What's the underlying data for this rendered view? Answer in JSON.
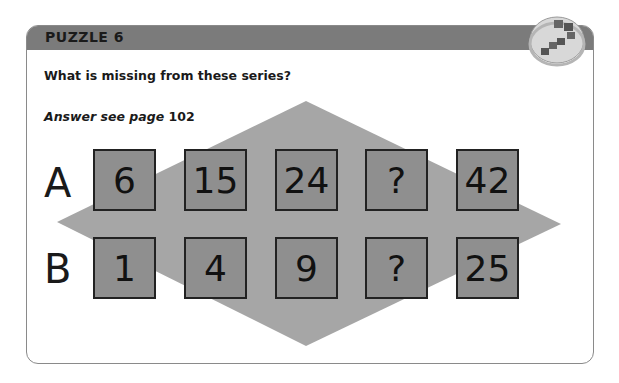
{
  "header": {
    "title": "PUZZLE 6"
  },
  "question": "What is missing from these series?",
  "answer": {
    "prefix": "Answer see page",
    "page": "102"
  },
  "rows": [
    {
      "label": "A",
      "values": [
        "6",
        "15",
        "24",
        "?",
        "42"
      ]
    },
    {
      "label": "B",
      "values": [
        "1",
        "4",
        "9",
        "?",
        "25"
      ]
    }
  ],
  "colors": {
    "header": "#7b7b7b",
    "box": "#8f8f8f",
    "diamond": "#a6a6a6",
    "border": "#8a8a8a"
  },
  "icons": {
    "badge": "puzzle-blocks-icon"
  }
}
